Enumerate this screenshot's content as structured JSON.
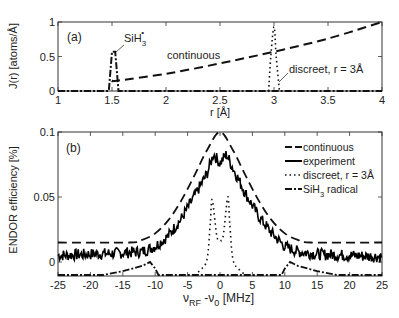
{
  "chart_data": [
    {
      "panel": "(a)",
      "type": "line",
      "xlabel": "r [Å]",
      "ylabel": "J(r) [atoms/Å]",
      "xlim": [
        1,
        4
      ],
      "ylim": [
        0,
        1
      ],
      "xticks": [
        "1",
        "1.5",
        "2",
        "2.5",
        "3",
        "3.5",
        "4"
      ],
      "yticks": [
        "0",
        "0.5",
        "1"
      ],
      "grid": false,
      "annotations": [
        {
          "text": "SiH3•",
          "x": 1.5,
          "y": 0.57
        },
        {
          "text": "continuous",
          "x": 2.0,
          "y": 0.3
        },
        {
          "text": "discreet, r = 3Å",
          "x": 3.0,
          "y": 0.3
        }
      ],
      "series": [
        {
          "name": "continuous",
          "style": "dashed",
          "x": [
            1.5,
            1.55,
            2.0,
            2.5,
            3.0,
            3.5,
            4.0
          ],
          "y": [
            0.15,
            0.15,
            0.25,
            0.4,
            0.57,
            0.76,
            1.0
          ]
        },
        {
          "name": "SiH3 radical",
          "style": "dash-dot",
          "x": [
            1.0,
            1.47,
            1.5,
            1.53,
            1.56,
            4.0
          ],
          "y": [
            0.0,
            0.0,
            0.57,
            0.57,
            0.0,
            0.0
          ]
        },
        {
          "name": "discreet, r = 3Å",
          "style": "dotted",
          "x": [
            2.95,
            2.97,
            3.0,
            3.02,
            3.05
          ],
          "y": [
            0.0,
            0.5,
            0.93,
            0.5,
            0.0
          ]
        }
      ]
    },
    {
      "panel": "(b)",
      "type": "line",
      "xlabel": "νRF - ν0 [MHz]",
      "ylabel": "ENDOR efficiency [%]",
      "xlim": [
        -25,
        25
      ],
      "ylim": [
        -0.011,
        0.1
      ],
      "xticks": [
        "-25",
        "-20",
        "-15",
        "-10",
        "-5",
        "0",
        "5",
        "10",
        "15",
        "20",
        "25"
      ],
      "yticks": [
        "0",
        "0.05",
        "0.1"
      ],
      "grid": false,
      "legend_position": "upper right",
      "legend": [
        "continuous",
        "experiment",
        "discreet, r = 3Å",
        "SiH3• radical"
      ],
      "series": [
        {
          "name": "continuous",
          "style": "dashed",
          "x": [
            -25,
            -14,
            -12,
            -10,
            -8,
            -6,
            -4,
            -2,
            0,
            2,
            4,
            6,
            8,
            10,
            12,
            14,
            25
          ],
          "y": [
            0.015,
            0.015,
            0.017,
            0.022,
            0.032,
            0.047,
            0.066,
            0.086,
            0.1,
            0.086,
            0.066,
            0.047,
            0.032,
            0.022,
            0.017,
            0.015,
            0.015
          ]
        },
        {
          "name": "experiment",
          "style": "solid",
          "x": [
            -25,
            -20,
            -15,
            -12,
            -10,
            -8,
            -6,
            -4,
            -2,
            -1,
            0,
            1,
            2,
            4,
            6,
            8,
            10,
            12,
            15,
            20,
            25
          ],
          "y": [
            0.005,
            0.006,
            0.007,
            0.008,
            0.012,
            0.02,
            0.033,
            0.05,
            0.068,
            0.083,
            0.076,
            0.083,
            0.072,
            0.052,
            0.035,
            0.022,
            0.012,
            0.008,
            0.006,
            0.005,
            0.004
          ]
        },
        {
          "name": "discreet, r = 3Å",
          "style": "dotted",
          "x": [
            -4,
            -3,
            -2,
            -1.5,
            -1.2,
            -0.5,
            0,
            0.5,
            1.2,
            1.5,
            2,
            3,
            4
          ],
          "y": [
            -0.01,
            -0.006,
            0.002,
            0.03,
            0.048,
            0.02,
            0.017,
            0.02,
            0.05,
            0.03,
            0.002,
            -0.006,
            -0.01
          ]
        },
        {
          "name": "SiH3• radical",
          "style": "dash-dot",
          "x": [
            -25,
            -18,
            -15,
            -12,
            -10.8,
            -10,
            -9.5,
            -5,
            0,
            5,
            9.5,
            10,
            10.8,
            12,
            15,
            18,
            25
          ],
          "y": [
            -0.01,
            -0.01,
            -0.007,
            -0.003,
            0.0,
            -0.005,
            -0.01,
            -0.01,
            -0.01,
            -0.01,
            -0.01,
            -0.005,
            0.0,
            -0.003,
            -0.007,
            -0.01,
            -0.01
          ]
        }
      ]
    }
  ],
  "panel_a": {
    "label": "(a)",
    "ylabel": "J(r) [atoms/Å]",
    "xlabel": "r [Å]",
    "yticks": [
      "0",
      "0.5",
      "1"
    ],
    "xticks": [
      "1",
      "1.5",
      "2",
      "2.5",
      "3",
      "3.5",
      "4"
    ],
    "annot_sih3_main": "SiH",
    "annot_sih3_sub": "3",
    "annot_sih3_sup": "•",
    "annot_continuous": "continuous",
    "annot_discreet": "discreet, r = 3Å"
  },
  "panel_b": {
    "label": "(b)",
    "ylabel": "ENDOR efficiency [%]",
    "xlabel_nu": "ν",
    "xlabel_rf": "RF",
    "xlabel_minus": " -ν",
    "xlabel_zero": "0",
    "xlabel_unit": " [MHz]",
    "yticks": [
      "0",
      "0.05",
      "0.1"
    ],
    "xticks": [
      "-25",
      "-20",
      "-15",
      "-10",
      "-5",
      "0",
      "5",
      "10",
      "15",
      "20",
      "25"
    ],
    "legend": {
      "continuous": "continuous",
      "experiment": "experiment",
      "discreet": "discreet, r = 3Å",
      "radical_main": "SiH",
      "radical_sub": "3",
      "radical_rest": " radical"
    }
  }
}
